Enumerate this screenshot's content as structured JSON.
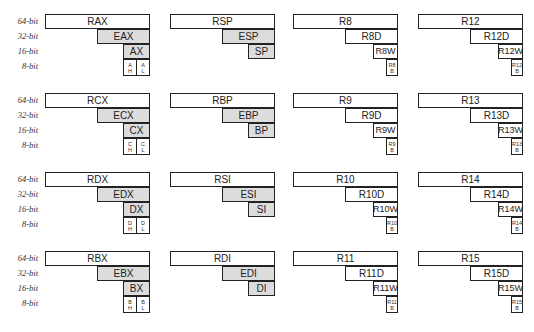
{
  "diagram": {
    "row_labels": [
      "64-bit",
      "32-bit",
      "16-bit",
      "8-bit"
    ],
    "fill_colors": {
      "white": "#ffffff",
      "gray": "#dcdcdc",
      "border": "#222222"
    },
    "blocks": [
      {
        "r64": "RAX",
        "r32": "EAX",
        "r16": "AX",
        "r8h": "A H",
        "r8l": "A L",
        "type": "hl"
      },
      {
        "r64": "RSP",
        "r32": "ESP",
        "r16": "SP",
        "type": "none"
      },
      {
        "r64": "R8",
        "r32": "R8D",
        "r16": "R8W",
        "r8": "R8 B",
        "type": "b"
      },
      {
        "r64": "R12",
        "r32": "R12D",
        "r16": "R12W",
        "r8": "R12 B",
        "type": "b"
      },
      {
        "r64": "RCX",
        "r32": "ECX",
        "r16": "CX",
        "r8h": "C H",
        "r8l": "C L",
        "type": "hl"
      },
      {
        "r64": "RBP",
        "r32": "EBP",
        "r16": "BP",
        "type": "none"
      },
      {
        "r64": "R9",
        "r32": "R9D",
        "r16": "R9W",
        "r8": "R9 B",
        "type": "b"
      },
      {
        "r64": "R13",
        "r32": "R13D",
        "r16": "R13W",
        "r8": "R13 B",
        "type": "b"
      },
      {
        "r64": "RDX",
        "r32": "EDX",
        "r16": "DX",
        "r8h": "D H",
        "r8l": "D L",
        "type": "hl"
      },
      {
        "r64": "RSI",
        "r32": "ESI",
        "r16": "SI",
        "type": "none"
      },
      {
        "r64": "R10",
        "r32": "R10D",
        "r16": "R10W",
        "r8": "R10 B",
        "type": "b"
      },
      {
        "r64": "R14",
        "r32": "R14D",
        "r16": "R14W",
        "r8": "R14 B",
        "type": "b"
      },
      {
        "r64": "RBX",
        "r32": "EBX",
        "r16": "BX",
        "r8h": "B H",
        "r8l": "B L",
        "type": "hl"
      },
      {
        "r64": "RDI",
        "r32": "EDI",
        "r16": "DI",
        "type": "none"
      },
      {
        "r64": "R11",
        "r32": "R11D",
        "r16": "R11W",
        "r8": "R11 B",
        "type": "b"
      },
      {
        "r64": "R15",
        "r32": "R15D",
        "r16": "R15W",
        "r8": "R15 B",
        "type": "b"
      }
    ]
  }
}
